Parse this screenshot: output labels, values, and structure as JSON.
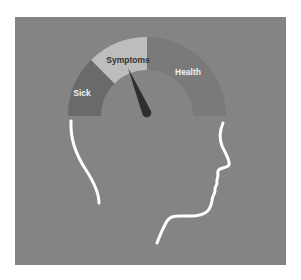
{
  "illustration": {
    "subject": "head-profile-with-health-gauge",
    "background_color": "#848484",
    "gauge": {
      "segments": [
        {
          "label": "Sick",
          "color": "#6a6a6a",
          "label_color": "#f2f2f2"
        },
        {
          "label": "Symptoms",
          "color": "#bdbdbd",
          "label_color": "#333333"
        },
        {
          "label": "Health",
          "color": "#7a7a7a",
          "label_color": "#f2f2f2"
        }
      ],
      "needle_color": "#2e2e2e",
      "needle_position": "Symptoms"
    },
    "outline_color": "#ffffff"
  }
}
